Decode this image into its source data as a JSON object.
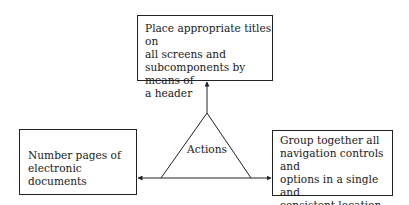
{
  "diagram": {
    "center": {
      "label": "Actions",
      "shape": "triangle"
    },
    "top_box": {
      "text": "Place appropriate titles on all screens and subcomponents by means of a header",
      "lines": [
        "Place appropriate titles on",
        "all screens and",
        "subcomponents by means of",
        "a header"
      ]
    },
    "left_box": {
      "text": "Number pages of electronic documents",
      "lines": [
        "Number pages of",
        "electronic documents"
      ]
    },
    "right_box": {
      "text": "Group together all navigation controls and options in a single and consistent location",
      "lines": [
        "Group together all",
        "navigation controls and",
        "options in a single and",
        "consistent location"
      ]
    },
    "edges": [
      {
        "from": "Actions",
        "to": "top_box",
        "direction": "up"
      },
      {
        "from": "Actions",
        "to": "left_box",
        "direction": "left"
      },
      {
        "from": "Actions",
        "to": "right_box",
        "direction": "right"
      }
    ],
    "colors": {
      "stroke": "#222222",
      "background": "#ffffff"
    }
  }
}
